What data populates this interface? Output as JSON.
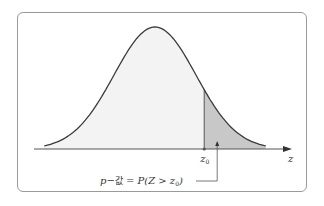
{
  "diagram": {
    "title": "",
    "distribution": "standard-normal",
    "axis_label": "z",
    "critical_value_label": "z",
    "critical_value_subscript": "0",
    "critical_value_z": 1.2,
    "annotation": {
      "prefix": "p",
      "dash": "−",
      "korean": "값",
      "equals": " = P(Z > z",
      "sub": "0",
      "close": ")"
    },
    "colors": {
      "curve": "#3a3a3a",
      "body_fill": "#f3f3f3",
      "tail_fill": "#c8c8c8",
      "axis": "#555555",
      "frame": "#9a9a9a"
    }
  }
}
